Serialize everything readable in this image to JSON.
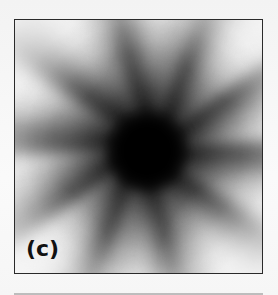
{
  "figure": {
    "panel_label": "(c)",
    "colors": {
      "border": "#2a2a2a",
      "center": "#000000",
      "edge": "#ececec",
      "label": "#111111",
      "rule": "#bdbdbd"
    }
  }
}
